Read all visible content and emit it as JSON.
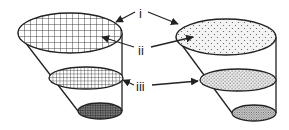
{
  "diagram": {
    "labels": [
      {
        "id": "i",
        "text": "i"
      },
      {
        "id": "ii",
        "text": "ii"
      },
      {
        "id": "iii",
        "text": "iii"
      }
    ],
    "left_cone": {
      "pattern": "grid-hatch"
    },
    "right_cone": {
      "pattern": "stipple-dots"
    },
    "colors": {
      "stroke": "#222222",
      "background": "#ffffff"
    }
  }
}
